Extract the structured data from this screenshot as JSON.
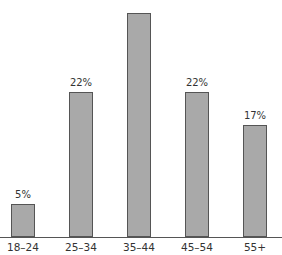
{
  "chart_data": {
    "type": "bar",
    "title": "",
    "xlabel": "",
    "ylabel": "",
    "categories": [
      "18–24",
      "25–34",
      "35–44",
      "45–54",
      "55+"
    ],
    "values": [
      5,
      22,
      34,
      22,
      17
    ],
    "data_labels": [
      "5%",
      "22%",
      "",
      "22%",
      "17%"
    ],
    "ylim": [
      0,
      36
    ],
    "grid": false,
    "legend": null,
    "bar_color": "#a9a9a9",
    "bar_edge_color": "#555555"
  }
}
